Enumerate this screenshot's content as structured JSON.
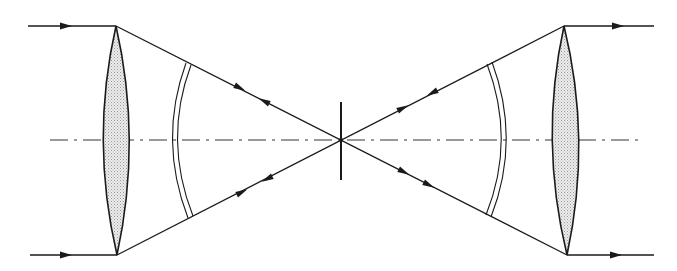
{
  "diagram": {
    "type": "optical-ray-diagram",
    "colors": {
      "background": "#ffffff",
      "stroke": "#1a1a1a",
      "lens_fill": "#d9d9d9",
      "axis": "#333333"
    },
    "optical_axis": {
      "y": 140,
      "x_start": 50,
      "x_end": 640,
      "style": "dash-dot"
    },
    "focal_point": {
      "x": 341,
      "y": 140
    },
    "stop": {
      "x": 341,
      "y_top": 102,
      "y_bottom": 180
    },
    "lenses": [
      {
        "id": "left-lens",
        "top": [
          116,
          26
        ],
        "bottom": [
          117,
          255
        ],
        "left_x": 103,
        "right_x": 128
      },
      {
        "id": "right-lens",
        "top": [
          564,
          26
        ],
        "bottom": [
          567,
          255
        ],
        "left_x": 553,
        "right_x": 578
      }
    ],
    "wavefronts": [
      {
        "id": "left-wavefront",
        "top": [
          188,
          63
        ],
        "bottom": [
          190,
          218
        ],
        "apex_x": 172
      },
      {
        "id": "right-wavefront",
        "top": [
          487,
          64
        ],
        "bottom": [
          488,
          215
        ],
        "apex_x": 505
      }
    ],
    "rays": [
      {
        "id": "ray-in-top",
        "from": [
          28,
          26
        ],
        "to": [
          116,
          26
        ],
        "arrow": "right"
      },
      {
        "id": "ray-in-bottom",
        "from": [
          30,
          255
        ],
        "to": [
          117,
          255
        ],
        "arrow": "right"
      },
      {
        "id": "ray-out-top",
        "from": [
          564,
          26
        ],
        "to": [
          654,
          26
        ],
        "arrow": "right"
      },
      {
        "id": "ray-out-bottom",
        "from": [
          567,
          255
        ],
        "to": [
          654,
          255
        ],
        "arrow": "right"
      },
      {
        "id": "ray-left-upper",
        "from": [
          116,
          26
        ],
        "to": [
          564,
          255
        ]
      },
      {
        "id": "ray-left-lower",
        "from": [
          117,
          255
        ],
        "to": [
          564,
          26
        ]
      }
    ],
    "arrowheads": [
      {
        "x": 65,
        "y": 26,
        "dir": 0
      },
      {
        "x": 66,
        "y": 255,
        "dir": 0
      },
      {
        "x": 618,
        "y": 26,
        "dir": 0
      },
      {
        "x": 616,
        "y": 255,
        "dir": 0
      },
      {
        "x": 239,
        "y": 89,
        "dir": 27
      },
      {
        "x": 264,
        "y": 102,
        "dir": 207
      },
      {
        "x": 404,
        "y": 172,
        "dir": 27
      },
      {
        "x": 430,
        "y": 186,
        "dir": 27
      },
      {
        "x": 242,
        "y": 192,
        "dir": -27
      },
      {
        "x": 267,
        "y": 179,
        "dir": 153
      },
      {
        "x": 403,
        "y": 108,
        "dir": -27
      },
      {
        "x": 432,
        "y": 93,
        "dir": 153
      }
    ]
  }
}
